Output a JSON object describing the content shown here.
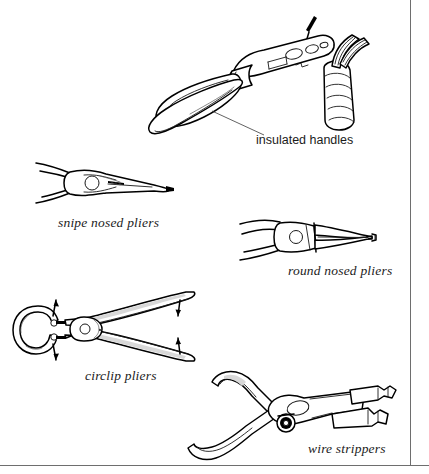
{
  "page": {
    "background_color": "#ffffff",
    "ink_color": "#000000",
    "frame_color": "#6e6e6e",
    "width": 429,
    "height": 474
  },
  "figures": [
    {
      "id": "wire-strippers-top",
      "name": "wire strippers with insulated handles gripping a cable",
      "caption": "",
      "callout": "insulated handles",
      "details": "stripper jaws cutting the outer sheath of a spiral-wrapped cable with stranded conductors emerging"
    },
    {
      "id": "snipe-nosed-pliers",
      "name": "snipe nosed pliers",
      "caption": "snipe nosed pliers",
      "callout": "",
      "details": "long tapering serrated jaws, side elevation"
    },
    {
      "id": "round-nosed-pliers",
      "name": "round nosed pliers",
      "caption": "round nosed pliers",
      "callout": "",
      "details": "tapered conical jaws, side elevation"
    },
    {
      "id": "circlip-pliers",
      "name": "circlip pliers",
      "caption": "circlip pliers",
      "callout": "",
      "details": "straight tipped pliers holding a C-shaped circlip, with four arrows showing handle squeeze and tip spread"
    },
    {
      "id": "wire-strippers-bottom",
      "name": "wire strippers",
      "caption": "wire strippers",
      "callout": "",
      "details": "curved handle wire strippers with notched stripping jaws and adjusting screw"
    }
  ],
  "captions": {
    "insulated_handles": "insulated handles",
    "snipe_nosed_pliers": "snipe nosed pliers",
    "round_nosed_pliers": "round nosed pliers",
    "circlip_pliers": "circlip pliers",
    "wire_strippers": "wire strippers"
  }
}
